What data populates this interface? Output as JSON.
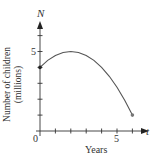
{
  "chart_data": {
    "type": "line",
    "title": "",
    "xlabel": "Years",
    "ylabel_line1": "Number of children",
    "ylabel_line2": "(millions)",
    "x_axis_var": "t",
    "y_axis_var": "N",
    "x_tick_labels": {
      "origin": "0",
      "five": "5"
    },
    "y_tick_labels": {
      "five": "5"
    },
    "xlim": [
      0,
      6.5
    ],
    "ylim": [
      0,
      6.5
    ],
    "x_ticks": [
      1,
      2,
      3,
      4,
      5,
      6
    ],
    "y_ticks": [
      1,
      2,
      3,
      4,
      5,
      6
    ],
    "grid": false,
    "series": [
      {
        "name": "N(t)",
        "x": [
          0,
          0.5,
          1,
          1.5,
          2,
          2.5,
          3,
          3.5,
          4,
          4.5,
          5,
          5.5,
          6
        ],
        "values": [
          4.0,
          4.44,
          4.75,
          4.94,
          5.0,
          4.94,
          4.75,
          4.44,
          4.0,
          3.44,
          2.75,
          1.94,
          1.0
        ]
      }
    ],
    "endpoints": [
      {
        "x": 0,
        "y": 4
      },
      {
        "x": 6,
        "y": 1
      }
    ]
  }
}
